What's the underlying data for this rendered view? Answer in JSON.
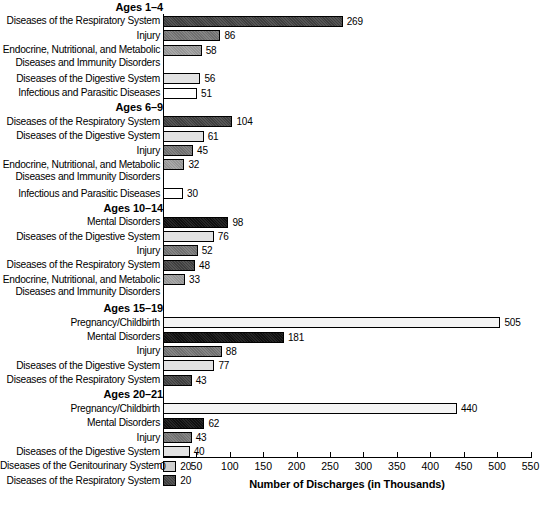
{
  "chart_data": {
    "type": "bar",
    "title": "",
    "xlabel": "Number of Discharges (in Thousands)",
    "ylabel": "",
    "orientation": "horizontal",
    "xlim": [
      0,
      550
    ],
    "xticks": [
      0,
      50,
      100,
      150,
      200,
      250,
      300,
      350,
      400,
      450,
      500,
      550
    ],
    "grid": false,
    "legend": "none",
    "groups": [
      {
        "title": "Ages 1–4",
        "bars": [
          {
            "label": "Diseases of the Respiratory System",
            "label_lines": [
              "Diseases of the Respiratory System"
            ],
            "value": 269,
            "fill": "f-dark"
          },
          {
            "label": "Injury",
            "label_lines": [
              "Injury"
            ],
            "value": 86,
            "fill": "f-medium"
          },
          {
            "label": "Endocrine, Nutritional, and Metabolic Diseases and Immunity Disorders",
            "label_lines": [
              "Endocrine, Nutritional, and Metabolic",
              "Diseases and Immunity Disorders"
            ],
            "value": 58,
            "fill": "f-midlight"
          },
          {
            "label": "Diseases of the Digestive System",
            "label_lines": [
              "Diseases of the Digestive System"
            ],
            "value": 56,
            "fill": "f-light"
          },
          {
            "label": "Infectious and Parasitic Diseases",
            "label_lines": [
              "Infectious and Parasitic Diseases"
            ],
            "value": 51,
            "fill": "f-white"
          }
        ]
      },
      {
        "title": "Ages 6–9",
        "bars": [
          {
            "label": "Diseases of the Respiratory System",
            "label_lines": [
              "Diseases of the Respiratory System"
            ],
            "value": 104,
            "fill": "f-dark"
          },
          {
            "label": "Diseases of the Digestive System",
            "label_lines": [
              "Diseases of the Digestive System"
            ],
            "value": 61,
            "fill": "f-light"
          },
          {
            "label": "Injury",
            "label_lines": [
              "Injury"
            ],
            "value": 45,
            "fill": "f-medium"
          },
          {
            "label": "Endocrine, Nutritional, and Metabolic Diseases and Immunity Disorders",
            "label_lines": [
              "Endocrine, Nutritional, and Metabolic",
              "Diseases and Immunity Disorders"
            ],
            "value": 32,
            "fill": "f-midlight"
          },
          {
            "label": "Infectious and Parasitic Diseases",
            "label_lines": [
              "Infectious and Parasitic Diseases"
            ],
            "value": 30,
            "fill": "f-white"
          }
        ]
      },
      {
        "title": "Ages 10–14",
        "bars": [
          {
            "label": "Mental Disorders",
            "label_lines": [
              "Mental Disorders"
            ],
            "value": 98,
            "fill": "f-black"
          },
          {
            "label": "Diseases of the Digestive System",
            "label_lines": [
              "Diseases of the Digestive System"
            ],
            "value": 76,
            "fill": "f-light"
          },
          {
            "label": "Injury",
            "label_lines": [
              "Injury"
            ],
            "value": 52,
            "fill": "f-medium"
          },
          {
            "label": "Diseases of the Respiratory System",
            "label_lines": [
              "Diseases of the Respiratory System"
            ],
            "value": 48,
            "fill": "f-dark"
          },
          {
            "label": "Endocrine, Nutritional, and Metabolic Diseases and Immunity Disorders",
            "label_lines": [
              "Endocrine, Nutritional, and Metabolic",
              "Diseases and Immunity Disorders"
            ],
            "value": 33,
            "fill": "f-midlight"
          }
        ]
      },
      {
        "title": "Ages 15–19",
        "bars": [
          {
            "label": "Pregnancy/Childbirth",
            "label_lines": [
              "Pregnancy/Childbirth"
            ],
            "value": 505,
            "fill": "f-palest"
          },
          {
            "label": "Mental Disorders",
            "label_lines": [
              "Mental Disorders"
            ],
            "value": 181,
            "fill": "f-black"
          },
          {
            "label": "Injury",
            "label_lines": [
              "Injury"
            ],
            "value": 88,
            "fill": "f-medium"
          },
          {
            "label": "Diseases of the Digestive System",
            "label_lines": [
              "Diseases of the Digestive System"
            ],
            "value": 77,
            "fill": "f-light"
          },
          {
            "label": "Diseases of the Respiratory System",
            "label_lines": [
              "Diseases of the Respiratory System"
            ],
            "value": 43,
            "fill": "f-dark"
          }
        ]
      },
      {
        "title": "Ages 20–21",
        "bars": [
          {
            "label": "Pregnancy/Childbirth",
            "label_lines": [
              "Pregnancy/Childbirth"
            ],
            "value": 440,
            "fill": "f-palest"
          },
          {
            "label": "Mental Disorders",
            "label_lines": [
              "Mental Disorders"
            ],
            "value": 62,
            "fill": "f-black"
          },
          {
            "label": "Injury",
            "label_lines": [
              "Injury"
            ],
            "value": 43,
            "fill": "f-medium"
          },
          {
            "label": "Diseases of the Digestive System",
            "label_lines": [
              "Diseases of the Digestive System"
            ],
            "value": 40,
            "fill": "f-light"
          },
          {
            "label": "Diseases of the Genitourinary System",
            "label_lines": [
              "Diseases of the Genitourinary System"
            ],
            "value": 20,
            "fill": "f-lighter"
          },
          {
            "label": "Diseases of the Respiratory System",
            "label_lines": [
              "Diseases of the Respiratory System"
            ],
            "value": 20,
            "fill": "f-dark"
          }
        ]
      }
    ]
  }
}
